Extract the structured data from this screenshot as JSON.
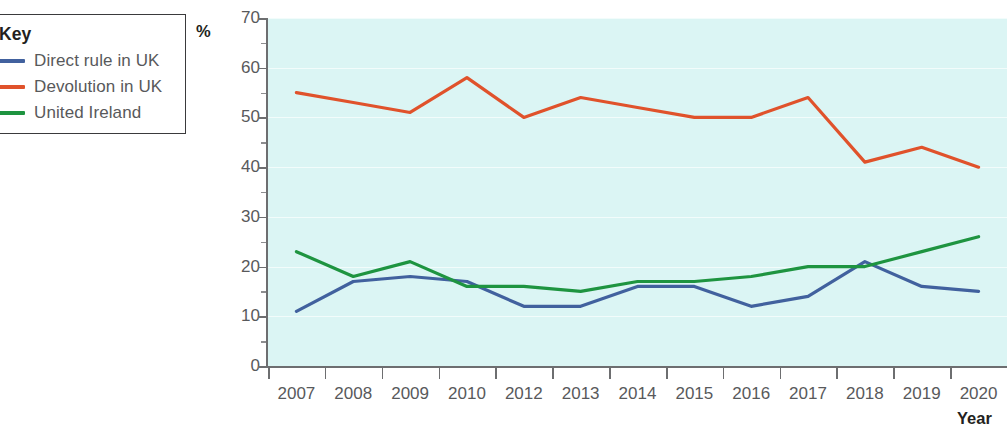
{
  "legend": {
    "title": "Key",
    "items": [
      {
        "label": "Direct rule in UK",
        "color": "#41619e"
      },
      {
        "label": "Devolution in UK",
        "color": "#e0522b"
      },
      {
        "label": "United Ireland",
        "color": "#1e9440"
      }
    ]
  },
  "axes": {
    "y_unit_label": "%",
    "x_title": "Year"
  },
  "chart_data": {
    "type": "line",
    "title": "",
    "xlabel": "Year",
    "ylabel": "%",
    "ylim": [
      0,
      70
    ],
    "ytick_step": 10,
    "grid": true,
    "legend_position": "top-left-outside",
    "plot_background": "#dbf5f4",
    "categories": [
      "2007",
      "2008",
      "2009",
      "2010",
      "2012",
      "2013",
      "2014",
      "2015",
      "2016",
      "2017",
      "2018",
      "2019",
      "2020"
    ],
    "ytick_labels": [
      "0",
      "10",
      "20",
      "30",
      "40",
      "50",
      "60",
      "70"
    ],
    "series": [
      {
        "name": "Direct rule in UK",
        "color": "#41619e",
        "values": [
          11,
          17,
          18,
          17,
          12,
          12,
          16,
          16,
          12,
          14,
          21,
          16,
          15
        ]
      },
      {
        "name": "Devolution in UK",
        "color": "#e0522b",
        "values": [
          55,
          53,
          51,
          58,
          50,
          54,
          52,
          50,
          50,
          54,
          41,
          44,
          40
        ]
      },
      {
        "name": "United Ireland",
        "color": "#1e9440",
        "values": [
          23,
          18,
          21,
          16,
          16,
          15,
          17,
          17,
          18,
          20,
          20,
          23,
          26
        ]
      }
    ]
  }
}
